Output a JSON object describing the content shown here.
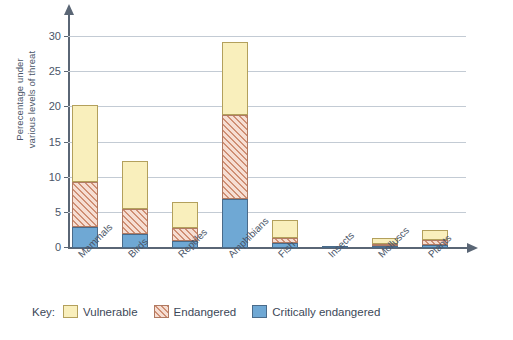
{
  "chart_data": {
    "type": "bar",
    "subtype": "stacked-bar",
    "title": "",
    "xlabel": "",
    "ylabel": "Perecentage under various levels of threat",
    "ylabel_lines": [
      "Perecentage under",
      "various levels of threat"
    ],
    "ylim": [
      0,
      31
    ],
    "yticks": [
      0,
      5,
      10,
      15,
      20,
      25,
      30
    ],
    "ytick_labels": [
      "0",
      "5",
      "10",
      "15",
      "20",
      "25",
      "30"
    ],
    "grid": "horizontal",
    "legend_position": "bottom-left",
    "categories": [
      "Mammals",
      "Birds",
      "Reptiles",
      "Amphibians",
      "Fish",
      "Insects",
      "Molluscs",
      "Plants"
    ],
    "series": [
      {
        "name": "Critically endangered",
        "color": "#6fa8d4",
        "pattern": "solid",
        "values": [
          3.0,
          2.0,
          1.0,
          7.0,
          0.7,
          0.3,
          0.2,
          0.4
        ]
      },
      {
        "name": "Endangered",
        "color": "#f6ded3",
        "pattern": "diagonal-hatch",
        "values": [
          6.4,
          3.6,
          1.9,
          11.9,
          0.7,
          0.0,
          0.2,
          0.8
        ]
      },
      {
        "name": "Vulnerable",
        "color": "#f9efbc",
        "pattern": "solid",
        "values": [
          10.9,
          6.8,
          3.6,
          10.4,
          2.6,
          0.0,
          0.9,
          1.4
        ]
      }
    ],
    "totals": [
      20.3,
      12.4,
      6.5,
      29.3,
      4.0,
      0.3,
      1.3,
      2.6
    ]
  },
  "legend": {
    "key_word": "Key:",
    "items": [
      {
        "label": "Vulnerable",
        "swatch": "vulnerable-swatch"
      },
      {
        "label": "Endangered",
        "swatch": "endangered-swatch"
      },
      {
        "label": "Critically endangered",
        "swatch": "critically-endangered-swatch"
      }
    ]
  },
  "colors": {
    "vulnerable": "#f9efbc",
    "endangered_fill": "#f6ded3",
    "endangered_hatch": "#cf8f74",
    "critically_endangered": "#6fa8d4",
    "axis": "#5a6675",
    "gridline": "#c3cbd4",
    "text": "#4a5568",
    "background": "#ffffff"
  }
}
